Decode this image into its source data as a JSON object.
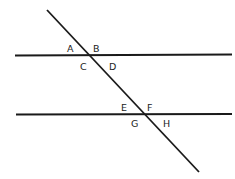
{
  "diagram": {
    "lines": [
      {
        "id": "parallel-top",
        "x1": 15,
        "y1": 55.5,
        "x2": 232,
        "y2": 54.5
      },
      {
        "id": "parallel-bottom",
        "x1": 16,
        "y1": 114.5,
        "x2": 232,
        "y2": 114
      },
      {
        "id": "transversal",
        "x1": 47,
        "y1": 10,
        "x2": 199,
        "y2": 172
      }
    ],
    "labels": [
      {
        "text": "A",
        "x": 67,
        "y": 52
      },
      {
        "text": "B",
        "x": 93,
        "y": 52
      },
      {
        "text": "C",
        "x": 80,
        "y": 70
      },
      {
        "text": "D",
        "x": 109,
        "y": 70
      },
      {
        "text": "E",
        "x": 121,
        "y": 111
      },
      {
        "text": "F",
        "x": 147,
        "y": 111
      },
      {
        "text": "G",
        "x": 131,
        "y": 127
      },
      {
        "text": "H",
        "x": 163,
        "y": 127
      }
    ],
    "stroke_color": "#1a1a1a"
  }
}
